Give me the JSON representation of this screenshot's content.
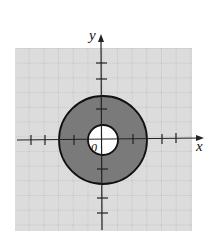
{
  "figure": {
    "type": "region-plot",
    "x_axis_label": "x",
    "y_axis_label": "y",
    "origin_label": "0",
    "region": {
      "shape": "annulus",
      "inner_radius": 1,
      "outer_radius": 3,
      "fill_color": "#7a7a7a",
      "boundary_color": "#111111"
    },
    "grid": {
      "background_color": "#d9d9d9",
      "line_color": "#a8a8a8",
      "style": "dotted",
      "unit_px": 14.7
    },
    "ticks": {
      "x": [
        -5,
        -4,
        -2,
        2,
        4,
        5
      ],
      "y": [
        -5,
        -4,
        -2,
        2,
        4,
        5
      ]
    }
  }
}
